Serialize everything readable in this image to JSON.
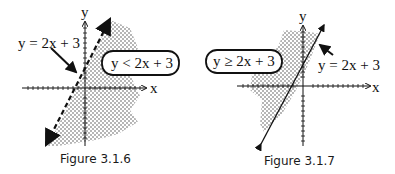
{
  "figures": [
    {
      "id": "fig1",
      "caption": "Figure 3.1.6",
      "line_label": "y = 2x + 3",
      "inequality_label": "y < 2x + 3",
      "x_axis_label": "x",
      "y_axis_label": "y",
      "boundary_style": "dashed",
      "shaded_side": "below-right"
    },
    {
      "id": "fig2",
      "caption": "Figure 3.1.7",
      "line_label": "y = 2x + 3",
      "inequality_label": "y ≥ 2x + 3",
      "x_axis_label": "x",
      "y_axis_label": "y",
      "boundary_style": "solid",
      "shaded_side": "above-left"
    }
  ]
}
